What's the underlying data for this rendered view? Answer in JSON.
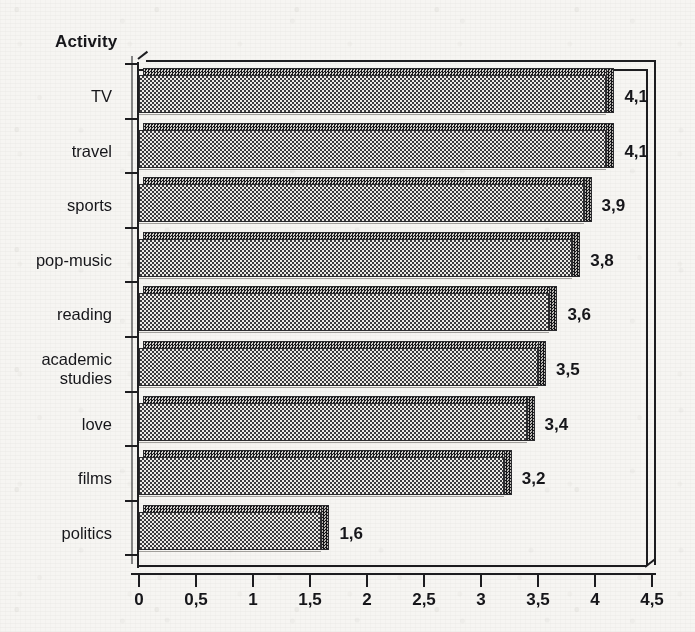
{
  "chart_data": {
    "type": "bar",
    "orientation": "horizontal",
    "title": "Activity",
    "xlabel": "",
    "ylabel": "Activity",
    "xlim": [
      0,
      4.5
    ],
    "grid": false,
    "legend": null,
    "decimal_separator": ",",
    "categories": [
      "TV",
      "travel",
      "sports",
      "pop-music",
      "reading",
      "academic studies",
      "love",
      "films",
      "politics"
    ],
    "values": [
      4.1,
      4.1,
      3.9,
      3.8,
      3.6,
      3.5,
      3.4,
      3.2,
      1.6
    ],
    "value_labels": [
      "4,1",
      "4,1",
      "3,9",
      "3,8",
      "3,6",
      "3,5",
      "3,4",
      "3,2",
      "1,6"
    ],
    "xticks": [
      0,
      0.5,
      1,
      1.5,
      2,
      2.5,
      3,
      3.5,
      4,
      4.5
    ],
    "xtick_labels": [
      "0",
      "0,5",
      "1",
      "1,5",
      "2",
      "2,5",
      "3",
      "3,5",
      "4",
      "4,5"
    ]
  },
  "axis_title": "Activity",
  "categories": [
    {
      "label": "TV",
      "value": 4.1,
      "value_label": "4,1"
    },
    {
      "label": "travel",
      "value": 4.1,
      "value_label": "4,1"
    },
    {
      "label": "sports",
      "value": 3.9,
      "value_label": "3,9"
    },
    {
      "label": "pop-music",
      "value": 3.8,
      "value_label": "3,8"
    },
    {
      "label": "reading",
      "value": 3.6,
      "value_label": "3,6"
    },
    {
      "label": "academic\nstudies",
      "value": 3.5,
      "value_label": "3,5"
    },
    {
      "label": "love",
      "value": 3.4,
      "value_label": "3,4"
    },
    {
      "label": "films",
      "value": 3.2,
      "value_label": "3,2"
    },
    {
      "label": "politics",
      "value": 1.6,
      "value_label": "1,6"
    }
  ],
  "xtick_labels": [
    "0",
    "0,5",
    "1",
    "1,5",
    "2",
    "2,5",
    "3",
    "3,5",
    "4",
    "4,5"
  ],
  "colors": {
    "ink": "#1d1d20",
    "paper": "#f6f5f2",
    "bar_fill": "#cfcdc9",
    "bar_shadow": "#4a4a4d"
  }
}
